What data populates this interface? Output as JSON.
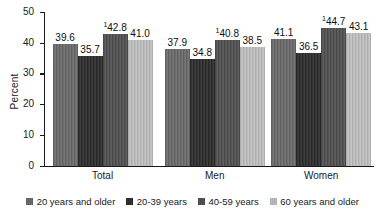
{
  "chart_data": {
    "type": "bar",
    "title": "",
    "xlabel": "",
    "ylabel": "Percent",
    "ylim": [
      0,
      50
    ],
    "yticks": [
      "0",
      "10",
      "20",
      "30",
      "40",
      "50"
    ],
    "grid": false,
    "legend_position": "bottom",
    "categories": [
      "Total",
      "Men",
      "Women"
    ],
    "series": [
      {
        "name": "20 years and older",
        "color": "#6e6e6e",
        "values": [
          39.6,
          37.9,
          41.1
        ],
        "labels": [
          "39.6",
          "37.9",
          "41.1"
        ],
        "footnote_marks": [
          "",
          "",
          ""
        ]
      },
      {
        "name": "20-39 years",
        "color": "#353535",
        "values": [
          35.7,
          34.8,
          36.5
        ],
        "labels": [
          "35.7",
          "34.8",
          "36.5"
        ],
        "footnote_marks": [
          "",
          "",
          ""
        ]
      },
      {
        "name": "40-59 years",
        "color": "#565656",
        "values": [
          42.8,
          40.8,
          44.7
        ],
        "labels": [
          "42.8",
          "40.8",
          "44.7"
        ],
        "footnote_marks": [
          "1",
          "1",
          "1"
        ]
      },
      {
        "name": "60 years and older",
        "color": "#bcbcbc",
        "values": [
          41.0,
          38.5,
          43.1
        ],
        "labels": [
          "41.0",
          "38.5",
          "43.1"
        ],
        "footnote_marks": [
          "",
          "",
          ""
        ]
      }
    ]
  }
}
